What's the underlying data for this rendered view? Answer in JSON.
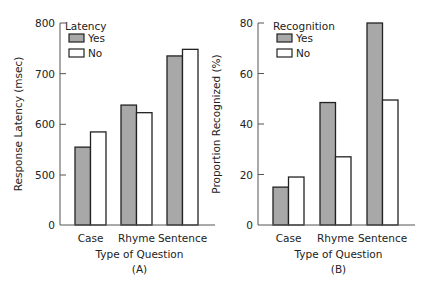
{
  "colors": {
    "yes": "#a8a8a8",
    "no": "#ffffff",
    "stroke": "#222222",
    "axis": "#555555"
  },
  "chart_data": [
    {
      "type": "bar",
      "panel_label": "(A)",
      "title": "",
      "xlabel": "Type of Question",
      "ylabel": "Response Latency (msec)",
      "categories": [
        "Case",
        "Rhyme",
        "Sentence"
      ],
      "legend_title": "Latency",
      "legend_position": "upper-left",
      "series": [
        {
          "name": "Yes",
          "values": [
            555,
            638,
            735
          ]
        },
        {
          "name": "No",
          "values": [
            585,
            623,
            748
          ]
        }
      ],
      "yticks": [
        0,
        500,
        600,
        700,
        800
      ],
      "ylim": [
        500,
        800
      ],
      "axis_break": "0 shown at base, scale starts at 500",
      "grid": false
    },
    {
      "type": "bar",
      "panel_label": "(B)",
      "title": "",
      "xlabel": "Type of Question",
      "ylabel": "Proportion Recognized (%)",
      "categories": [
        "Case",
        "Rhyme",
        "Sentence"
      ],
      "legend_title": "Recognition",
      "legend_position": "upper-left",
      "series": [
        {
          "name": "Yes",
          "values": [
            15,
            48.5,
            80
          ]
        },
        {
          "name": "No",
          "values": [
            19,
            27,
            49.5
          ]
        }
      ],
      "yticks": [
        0,
        20,
        40,
        60,
        80
      ],
      "ylim": [
        0,
        80
      ],
      "grid": false
    }
  ]
}
